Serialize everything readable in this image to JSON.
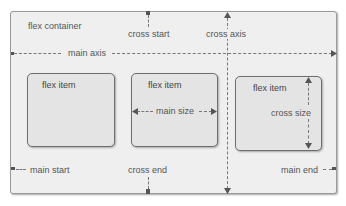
{
  "diagram": {
    "container_label": "flex container",
    "axes": {
      "main_axis": "main axis",
      "cross_axis": "cross axis",
      "cross_start": "cross start",
      "cross_end": "cross end",
      "main_start": "main start",
      "main_end": "main end"
    },
    "items": [
      {
        "label": "flex item"
      },
      {
        "label": "flex item",
        "annotation": "main size"
      },
      {
        "label": "flex item",
        "annotation": "cross size"
      }
    ],
    "colors": {
      "container_fill": "#efefef",
      "item_fill": "#e4e4e4",
      "border": "#6f6f6f",
      "text": "#555555"
    }
  }
}
